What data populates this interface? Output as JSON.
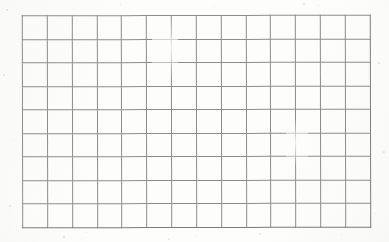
{
  "document": {
    "kind": "blank-grid-worksheet",
    "medium": "scanned-paper",
    "title": "",
    "text_content": "",
    "notes": ""
  },
  "page": {
    "width_px": 389,
    "height_px": 242,
    "background_color": "#fdfdfc"
  },
  "grid": {
    "columns": 14,
    "rows": 9,
    "total_cells": 126,
    "line_color": "#8c8c8a",
    "line_width_px": 1,
    "cell_fill": "transparent",
    "cell_width_px": 25,
    "cell_height_px": 24,
    "offset_left_px": 22,
    "offset_top_px": 15,
    "grid_width_px": 349,
    "grid_height_px": 213,
    "cells": [
      [
        "",
        "",
        "",
        "",
        "",
        "",
        "",
        "",
        "",
        "",
        "",
        "",
        "",
        ""
      ],
      [
        "",
        "",
        "",
        "",
        "",
        "",
        "",
        "",
        "",
        "",
        "",
        "",
        "",
        ""
      ],
      [
        "",
        "",
        "",
        "",
        "",
        "",
        "",
        "",
        "",
        "",
        "",
        "",
        "",
        ""
      ],
      [
        "",
        "",
        "",
        "",
        "",
        "",
        "",
        "",
        "",
        "",
        "",
        "",
        "",
        ""
      ],
      [
        "",
        "",
        "",
        "",
        "",
        "",
        "",
        "",
        "",
        "",
        "",
        "",
        "",
        ""
      ],
      [
        "",
        "",
        "",
        "",
        "",
        "",
        "",
        "",
        "",
        "",
        "",
        "",
        "",
        ""
      ],
      [
        "",
        "",
        "",
        "",
        "",
        "",
        "",
        "",
        "",
        "",
        "",
        "",
        "",
        ""
      ],
      [
        "",
        "",
        "",
        "",
        "",
        "",
        "",
        "",
        "",
        "",
        "",
        "",
        "",
        ""
      ],
      [
        "",
        "",
        "",
        "",
        "",
        "",
        "",
        "",
        "",
        "",
        "",
        "",
        "",
        ""
      ]
    ]
  },
  "artifacts": {
    "speckles": [
      {
        "x": 6,
        "y": 9,
        "size": 2
      },
      {
        "x": 3,
        "y": 74,
        "size": 2
      },
      {
        "x": 14,
        "y": 140,
        "size": 1
      },
      {
        "x": 9,
        "y": 205,
        "size": 2
      },
      {
        "x": 63,
        "y": 236,
        "size": 2
      },
      {
        "x": 120,
        "y": 4,
        "size": 1
      },
      {
        "x": 168,
        "y": 238,
        "size": 2
      },
      {
        "x": 214,
        "y": 6,
        "size": 1
      },
      {
        "x": 259,
        "y": 233,
        "size": 2
      },
      {
        "x": 303,
        "y": 3,
        "size": 2
      },
      {
        "x": 318,
        "y": 5,
        "size": 1
      },
      {
        "x": 341,
        "y": 234,
        "size": 1
      },
      {
        "x": 378,
        "y": 62,
        "size": 2
      },
      {
        "x": 383,
        "y": 151,
        "size": 2
      },
      {
        "x": 375,
        "y": 213,
        "size": 1
      },
      {
        "x": 86,
        "y": 232,
        "size": 1
      },
      {
        "x": 196,
        "y": 236,
        "size": 1
      },
      {
        "x": 246,
        "y": 9,
        "size": 1
      }
    ],
    "fade_patches": [
      {
        "x": 152,
        "y": 18,
        "w": 26,
        "h": 60
      },
      {
        "x": 286,
        "y": 118,
        "w": 22,
        "h": 50
      }
    ]
  }
}
